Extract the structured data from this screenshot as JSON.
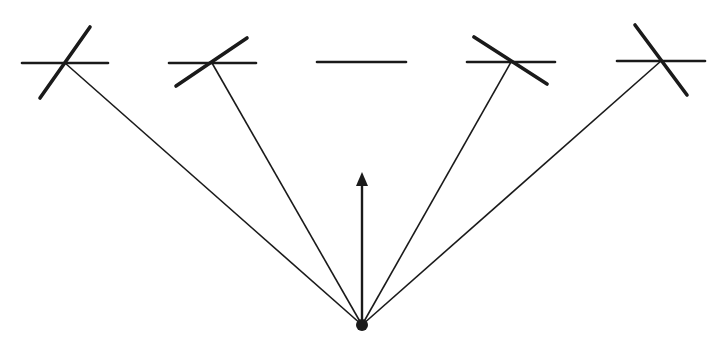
{
  "diagram": {
    "colors": {
      "stroke": "#1a1a1a",
      "background": "#ffffff"
    },
    "origin": {
      "x": 362,
      "y": 325,
      "r": 6
    },
    "arrow": {
      "x": 362,
      "y_start": 325,
      "y_tip": 172,
      "head_len": 14,
      "head_half_w": 6
    },
    "elements": [
      {
        "id": "element-1",
        "cx": 65,
        "cy": 63,
        "h_line": [
          22,
          108
        ],
        "tilt": [
          40,
          98,
          90,
          27
        ],
        "connect": true
      },
      {
        "id": "element-2",
        "cx": 212,
        "cy": 63,
        "h_line": [
          169,
          256
        ],
        "tilt": [
          176,
          86,
          247,
          38
        ],
        "connect": true
      },
      {
        "id": "element-3",
        "cx": 362,
        "cy": 62,
        "h_line": [
          317,
          406
        ],
        "tilt": null,
        "connect": false
      },
      {
        "id": "element-4",
        "cx": 511,
        "cy": 62,
        "h_line": [
          467,
          555
        ],
        "tilt": [
          474,
          37,
          547,
          84
        ],
        "connect": true
      },
      {
        "id": "element-5",
        "cx": 661,
        "cy": 61,
        "h_line": [
          617,
          705
        ],
        "tilt": [
          635,
          25,
          687,
          95
        ],
        "connect": true
      }
    ]
  }
}
